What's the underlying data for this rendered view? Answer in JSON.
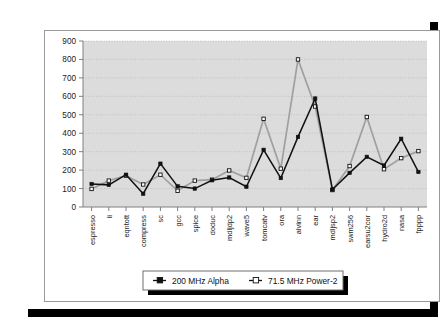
{
  "chart_data": {
    "type": "line",
    "title": "",
    "xlabel": "",
    "ylabel": "",
    "ylim": [
      0,
      900
    ],
    "ytick_step": 100,
    "yticks": [
      0,
      100,
      200,
      300,
      400,
      500,
      600,
      700,
      800,
      900
    ],
    "grid": true,
    "legend_position": "bottom",
    "categories": [
      "espresso",
      "li",
      "eqntott",
      "compress",
      "sc",
      "gcc",
      "spice",
      "doduc",
      "mdljdp2",
      "wave5",
      "tomcatv",
      "ora",
      "alvinn",
      "ear",
      "mdljsp2",
      "swm256",
      "earsu2cor",
      "hydro2d",
      "nasa",
      "fpppp"
    ],
    "series": [
      {
        "name": "200 MHz Alpha",
        "marker": "filled-square",
        "color": "#111111",
        "values": [
          125,
          120,
          175,
          72,
          235,
          112,
          100,
          145,
          160,
          110,
          310,
          157,
          380,
          588,
          95,
          185,
          272,
          225,
          370,
          190
        ]
      },
      {
        "name": "71.5 MHz Power-2",
        "marker": "open-square",
        "color": "#a0a0a0",
        "values": [
          98,
          143,
          170,
          122,
          175,
          88,
          143,
          148,
          198,
          158,
          478,
          208,
          800,
          545,
          92,
          222,
          488,
          205,
          265,
          303
        ]
      }
    ]
  },
  "legend": {
    "entries": [
      {
        "label": "200 MHz Alpha",
        "marker": "filled-square"
      },
      {
        "label": "71.5 MHz Power-2",
        "marker": "open-square"
      }
    ]
  },
  "colors": {
    "plot_background": "#dcdcdc",
    "page_background": "#ffffff",
    "grid": "#b4b4b4",
    "axis": "#808080",
    "series_alpha": "#111111",
    "series_power2": "#a0a0a0"
  }
}
